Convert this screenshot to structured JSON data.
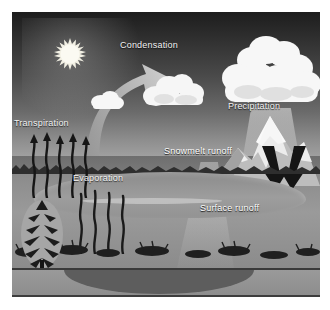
{
  "diagram": {
    "type": "water-cycle-illustration",
    "style": "grayscale",
    "labels": {
      "condensation": "Condensation",
      "precipitation": "Precipitation",
      "transpiration": "Transpiration",
      "evaporation": "Evaporation",
      "snowmelt_runoff": "Snowmelt runoff",
      "surface_runoff": "Surface runoff"
    },
    "elements": {
      "sun": "sun-icon",
      "small_cloud": "small-cloud",
      "middle_cloud": "cumulus-cloud",
      "storm_cloud": "large-storm-cloud",
      "rain_shaft": "rain-fall",
      "mountain": "snow-capped-mountain",
      "melt_arrows": "downward-arrows",
      "updraft_arrow": "curved-up-arrow",
      "lake": "lake",
      "tree": "evergreen-tree",
      "roots": "tree-roots",
      "water_table": "water-table-line",
      "aquifer": "groundwater-lens"
    },
    "colors": {
      "sky_top": "#1d1d1d",
      "sky_bottom": "#a8a8a8",
      "ground": "#8e8e8e",
      "cloud": "#f5f5f5",
      "label_text": "#f2f2f2",
      "aquifer": "#5d5d5d",
      "arrow_dark": "#1a1a1a"
    }
  }
}
